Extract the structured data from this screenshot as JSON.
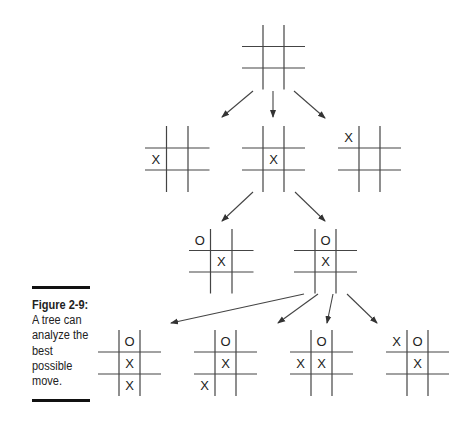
{
  "caption": {
    "figure_label": "Figure 2-9:",
    "lines": [
      "A tree can",
      "analyze the",
      "best",
      "possible",
      "move."
    ]
  },
  "colors": {
    "line": "#444444",
    "text": "#222222",
    "background": "#ffffff"
  },
  "tree": {
    "root": {
      "id": "root",
      "cells": [
        "",
        "",
        "",
        "",
        "",
        "",
        "",
        "",
        ""
      ]
    },
    "level1": [
      {
        "id": "l1-a",
        "cells": [
          "",
          "",
          "",
          "X",
          "",
          "",
          "",
          "",
          ""
        ]
      },
      {
        "id": "l1-b",
        "cells": [
          "",
          "",
          "",
          "",
          "X",
          "",
          "",
          "",
          ""
        ]
      },
      {
        "id": "l1-c",
        "cells": [
          "X",
          "",
          "",
          "",
          "",
          "",
          "",
          "",
          ""
        ]
      }
    ],
    "level2": [
      {
        "id": "l2-a",
        "cells": [
          "O",
          "",
          "",
          "",
          "X",
          "",
          "",
          "",
          ""
        ]
      },
      {
        "id": "l2-b",
        "cells": [
          "",
          "O",
          "",
          "",
          "X",
          "",
          "",
          "",
          ""
        ]
      }
    ],
    "level3": [
      {
        "id": "l3-a",
        "cells": [
          "",
          "O",
          "",
          "",
          "X",
          "",
          "",
          "X",
          ""
        ]
      },
      {
        "id": "l3-b",
        "cells": [
          "",
          "O",
          "",
          "",
          "X",
          "",
          "X",
          "",
          ""
        ]
      },
      {
        "id": "l3-c",
        "cells": [
          "",
          "O",
          "",
          "X",
          "X",
          "",
          "",
          "",
          ""
        ]
      },
      {
        "id": "l3-d",
        "cells": [
          "X",
          "O",
          "",
          "",
          "X",
          "",
          "",
          "",
          ""
        ]
      }
    ]
  }
}
